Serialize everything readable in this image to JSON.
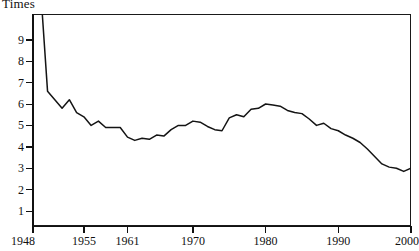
{
  "chart_data": {
    "type": "line",
    "title": "",
    "ylabel": "Times",
    "xlabel": "",
    "xlim": [
      1948,
      2000
    ],
    "ylim": [
      0.6,
      10.9
    ],
    "grid": false,
    "legend": "none",
    "yticks": [
      9,
      8,
      7,
      6,
      5,
      4,
      3,
      2,
      1
    ],
    "xticks": [
      1948,
      1955,
      1961,
      1970,
      1980,
      1990,
      2000
    ],
    "note": "Series begins above the top of the plot area in 1948 and is clipped by the frame.",
    "x": [
      1948,
      1949,
      1950,
      1951,
      1952,
      1953,
      1954,
      1955,
      1956,
      1957,
      1958,
      1959,
      1960,
      1961,
      1962,
      1963,
      1964,
      1965,
      1966,
      1967,
      1968,
      1969,
      1970,
      1971,
      1972,
      1973,
      1974,
      1975,
      1976,
      1977,
      1978,
      1979,
      1980,
      1981,
      1982,
      1983,
      1984,
      1985,
      1986,
      1987,
      1988,
      1989,
      1990,
      1991,
      1992,
      1993,
      1994,
      1995,
      1996,
      1997,
      1998,
      1999,
      2000
    ],
    "values": [
      12.4,
      11.6,
      6.6,
      6.2,
      5.8,
      6.2,
      5.6,
      5.4,
      5.0,
      5.2,
      4.9,
      4.9,
      4.9,
      4.45,
      4.3,
      4.4,
      4.35,
      4.55,
      4.5,
      4.8,
      5.0,
      5.0,
      5.2,
      5.15,
      4.95,
      4.8,
      4.75,
      5.35,
      5.5,
      5.4,
      5.75,
      5.8,
      6.0,
      5.95,
      5.9,
      5.7,
      5.6,
      5.55,
      5.3,
      5.0,
      5.1,
      4.85,
      4.75,
      4.55,
      4.4,
      4.2,
      3.9,
      3.55,
      3.2,
      3.05,
      3.0,
      2.85,
      3.0
    ],
    "series": [
      {
        "name": "Times",
        "values": [
          12.4,
          11.6,
          6.6,
          6.2,
          5.8,
          6.2,
          5.6,
          5.4,
          5.0,
          5.2,
          4.9,
          4.9,
          4.9,
          4.45,
          4.3,
          4.4,
          4.35,
          4.55,
          4.5,
          4.8,
          5.0,
          5.0,
          5.2,
          5.15,
          4.95,
          4.8,
          4.75,
          5.35,
          5.5,
          5.4,
          5.75,
          5.8,
          6.0,
          5.95,
          5.9,
          5.7,
          5.6,
          5.55,
          5.3,
          5.0,
          5.1,
          4.85,
          4.75,
          4.55,
          4.4,
          4.2,
          3.9,
          3.55,
          3.2,
          3.05,
          3.0,
          2.85,
          3.0
        ]
      }
    ]
  },
  "axis": {
    "y_title": "Times",
    "y_tick_labels": [
      "9",
      "8",
      "7",
      "6",
      "5",
      "4",
      "3",
      "2",
      "1"
    ],
    "x_tick_labels": [
      "1948",
      "1955",
      "1961",
      "1970",
      "1980",
      "1990",
      "2000"
    ]
  }
}
